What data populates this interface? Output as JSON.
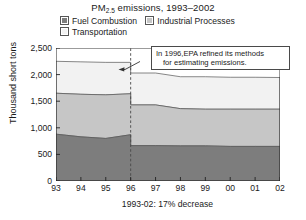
{
  "title": {
    "prefix": "PM",
    "subscript": "2.5",
    "suffix": " emissions, 1993–2002",
    "full": "PM2.5 emissions, 1993–2002"
  },
  "legend": {
    "position": "top",
    "items": [
      {
        "label": "Fuel Combustion",
        "color": "#7d7d7d",
        "icon": "legend-swatch-icon"
      },
      {
        "label": "Industrial Processes",
        "color": "#c6c6c6",
        "icon": "legend-swatch-icon"
      },
      {
        "label": "Transportation",
        "color": "#f2f2f2",
        "icon": "legend-swatch-icon"
      }
    ]
  },
  "axes": {
    "ylabel": "Thousand short tons",
    "yticks": [
      "2,500",
      "2,000",
      "1,500",
      "1,000",
      "500",
      "0"
    ],
    "xticks": [
      "93",
      "94",
      "95",
      "96",
      "97",
      "98",
      "99",
      "00",
      "01",
      "02"
    ],
    "footnote": "1993-02: 17%  decrease"
  },
  "annotation": {
    "line1": "In 1996,EPA refined its methods",
    "line2": "for estimating emissions.",
    "full": "In 1996, EPA refined its methods for estimating emissions.",
    "marker_year": "96"
  },
  "chart_data": {
    "type": "area",
    "stacked": true,
    "title": "PM2.5 emissions, 1993–2002",
    "xlabel": "",
    "ylabel": "Thousand short tons",
    "units": "Thousand short tons",
    "x": [
      "93",
      "94",
      "95",
      "96",
      "97",
      "98",
      "99",
      "00",
      "01",
      "02"
    ],
    "ylim": [
      0,
      2500
    ],
    "ytick_values": [
      0,
      500,
      1000,
      1500,
      2000,
      2500
    ],
    "grid": false,
    "legend_position": "top",
    "series": [
      {
        "name": "Fuel Combustion",
        "color": "#7d7d7d",
        "values": [
          880,
          830,
          800,
          870,
          665,
          660,
          660,
          650,
          650,
          650
        ]
      },
      {
        "name": "Industrial Processes",
        "color": "#c6c6c6",
        "values": [
          770,
          800,
          820,
          770,
          765,
          700,
          690,
          700,
          700,
          700
        ]
      },
      {
        "name": "Transportation",
        "color": "#f2f2f2",
        "values": [
          600,
          610,
          610,
          590,
          600,
          600,
          610,
          600,
          600,
          595
        ]
      }
    ],
    "cumulative_tops": {
      "Fuel Combustion": [
        880,
        830,
        800,
        870,
        665,
        660,
        660,
        650,
        650,
        650
      ],
      "Industrial Processes": [
        1650,
        1630,
        1620,
        1640,
        1430,
        1360,
        1350,
        1350,
        1350,
        1350
      ],
      "Transportation": [
        2250,
        2240,
        2230,
        2230,
        2030,
        1960,
        1960,
        1950,
        1950,
        1945
      ]
    },
    "annotations": [
      {
        "type": "vline",
        "x": "96",
        "style": "dashed",
        "text": "In 1996, EPA refined its methods for estimating emissions."
      }
    ],
    "footnote": "1993-02: 17%  decrease"
  }
}
